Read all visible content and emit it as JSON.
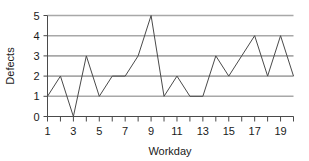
{
  "chart_data": {
    "type": "line",
    "title": "",
    "xlabel": "Workday",
    "ylabel": "Defects",
    "x": [
      1,
      2,
      3,
      4,
      5,
      6,
      7,
      8,
      9,
      10,
      11,
      12,
      13,
      14,
      15,
      16,
      17,
      18,
      19,
      20
    ],
    "values": [
      1,
      2,
      0,
      3,
      1,
      2,
      2,
      3,
      5,
      1,
      2,
      1,
      1,
      3,
      2,
      3,
      4,
      2,
      4,
      2
    ],
    "series": [
      {
        "name": "Defects",
        "values": [
          1,
          2,
          0,
          3,
          1,
          2,
          2,
          3,
          5,
          1,
          2,
          1,
          1,
          3,
          2,
          3,
          4,
          2,
          4,
          2
        ]
      }
    ],
    "xlim": [
      1,
      20
    ],
    "ylim": [
      0,
      5
    ],
    "y_ticks": [
      0,
      1,
      2,
      3,
      4,
      5
    ],
    "y_tick_labels": [
      "0",
      "1",
      "2",
      "3",
      "4",
      "5"
    ],
    "x_ticks": [
      1,
      2,
      3,
      4,
      5,
      6,
      7,
      8,
      9,
      10,
      11,
      12,
      13,
      14,
      15,
      16,
      17,
      18,
      19,
      20
    ],
    "x_tick_labels": [
      "1",
      "",
      "3",
      "",
      "5",
      "",
      "7",
      "",
      "9",
      "",
      "11",
      "",
      "13",
      "",
      "15",
      "",
      "17",
      "",
      "19",
      ""
    ],
    "grid": true,
    "grid_axis": "y",
    "legend": false,
    "legend_position": "none",
    "colors": {
      "line": "#4a4a4a",
      "grid": "#a8a8a8",
      "axis": "#4a4a4a",
      "text": "#1a1a1a",
      "background": "#ffffff"
    }
  }
}
